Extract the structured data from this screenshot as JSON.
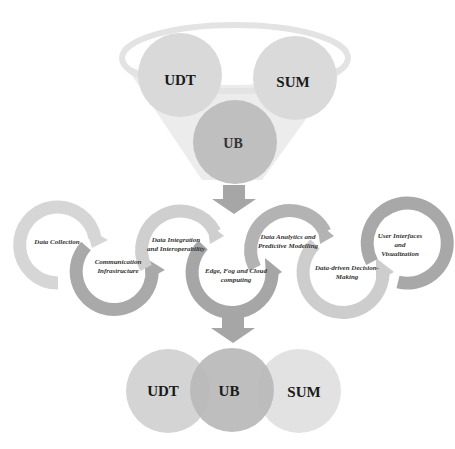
{
  "funnel": {
    "circles": [
      {
        "id": "udt",
        "label": "UDT",
        "color": "#d9d9d9"
      },
      {
        "id": "sum",
        "label": "SUM",
        "color": "#dadada"
      },
      {
        "id": "ub",
        "label": "UB",
        "color": "#bfbfbf"
      }
    ],
    "rim_color": "#e6e6e6",
    "body_color": "#ececec"
  },
  "process": {
    "steps": [
      {
        "label": "Data Collection",
        "arrow_color": "#d6d6d6"
      },
      {
        "label": "Communication\nInfrastructure",
        "arrow_color": "#a9a9a9"
      },
      {
        "label": "Data Integration\nand Interoperability",
        "arrow_color": "#cfcfcf"
      },
      {
        "label": "Edge, Fog and Cloud\ncomputing",
        "arrow_color": "#a6a6a6"
      },
      {
        "label": "Data Analytics and\nPredictive Modelling",
        "arrow_color": "#b3b3b3"
      },
      {
        "label": "Data-driven Decision-\nMaking",
        "arrow_color": "#cdcdcd"
      },
      {
        "label": "User Interfaces and\nVisualization",
        "arrow_color": "#a8a8a8"
      }
    ]
  },
  "arrows_color": "#a6a6a6",
  "result": {
    "circles": [
      {
        "id": "udt",
        "label": "UDT",
        "color": "#d4d4d4"
      },
      {
        "id": "ub",
        "label": "UB",
        "color": "#b8b8b8"
      },
      {
        "id": "sum",
        "label": "SUM",
        "color": "#e2e2e2"
      }
    ]
  }
}
